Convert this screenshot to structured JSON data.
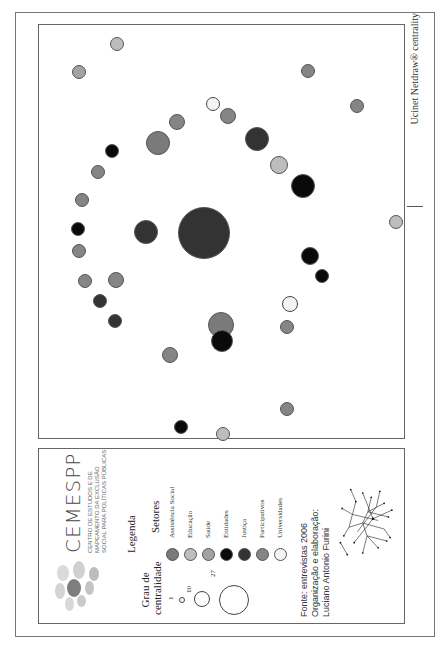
{
  "map": {
    "credit": "Ucinet Netdraw® centrality",
    "nodes": [
      {
        "u": 603,
        "v": 117,
        "r": 7,
        "sector": "Educação"
      },
      {
        "u": 575,
        "v": 79,
        "r": 7,
        "sector": "Saúde"
      },
      {
        "u": 576,
        "v": 308,
        "r": 7,
        "sector": "Participativos"
      },
      {
        "u": 541,
        "v": 357,
        "r": 7,
        "sector": "Participativos"
      },
      {
        "u": 543,
        "v": 213,
        "r": 7,
        "sector": "Universidades"
      },
      {
        "u": 531,
        "v": 228,
        "r": 8,
        "sector": "Participativos"
      },
      {
        "u": 525,
        "v": 177,
        "r": 8,
        "sector": "Participativos"
      },
      {
        "u": 504,
        "v": 158,
        "r": 12,
        "sector": "Assistência Social"
      },
      {
        "u": 508,
        "v": 257,
        "r": 12,
        "sector": "Justiça"
      },
      {
        "u": 496,
        "v": 112,
        "r": 7,
        "sector": "Entidades"
      },
      {
        "u": 482,
        "v": 279,
        "r": 9,
        "sector": "Educação"
      },
      {
        "u": 475,
        "v": 98,
        "r": 7,
        "sector": "Participativos"
      },
      {
        "u": 461,
        "v": 303,
        "r": 12,
        "sector": "Entidades"
      },
      {
        "u": 447,
        "v": 82,
        "r": 7,
        "sector": "Participativos"
      },
      {
        "u": 425,
        "v": 396,
        "r": 7,
        "sector": "Educação"
      },
      {
        "u": 418,
        "v": 78,
        "r": 7,
        "sector": "Entidades"
      },
      {
        "u": 415,
        "v": 146,
        "r": 12,
        "sector": "Justiça"
      },
      {
        "u": 414,
        "v": 204,
        "r": 26,
        "sector": "Justiça"
      },
      {
        "u": 396,
        "v": 79,
        "r": 7,
        "sector": "Participativos"
      },
      {
        "u": 391,
        "v": 310,
        "r": 9,
        "sector": "Entidades"
      },
      {
        "u": 371,
        "v": 322,
        "r": 7,
        "sector": "Entidades"
      },
      {
        "u": 366,
        "v": 85,
        "r": 7,
        "sector": "Participativos"
      },
      {
        "u": 367,
        "v": 116,
        "r": 8,
        "sector": "Participativos"
      },
      {
        "u": 346,
        "v": 100,
        "r": 7,
        "sector": "Justiça"
      },
      {
        "u": 343,
        "v": 290,
        "r": 8,
        "sector": "Universidades"
      },
      {
        "u": 326,
        "v": 115,
        "r": 7,
        "sector": "Justiça"
      },
      {
        "u": 322,
        "v": 221,
        "r": 13,
        "sector": "Assistência Social"
      },
      {
        "u": 320,
        "v": 287,
        "r": 7,
        "sector": "Participativos"
      },
      {
        "u": 306,
        "v": 222,
        "r": 11,
        "sector": "Entidades"
      },
      {
        "u": 292,
        "v": 170,
        "r": 8,
        "sector": "Participativos"
      },
      {
        "u": 238,
        "v": 287,
        "r": 7,
        "sector": "Participativos"
      },
      {
        "u": 220,
        "v": 181,
        "r": 7,
        "sector": "Entidades"
      },
      {
        "u": 213,
        "v": 223,
        "r": 7,
        "sector": "Educação"
      }
    ]
  },
  "legend": {
    "logo": {
      "title": "CEMESPP",
      "subtitle": "Centro de Estudos e de Mapeamento da Exclusão Social para Políticas Públicas"
    },
    "heading": "Legenda",
    "centrality_heading_line1": "Grau de",
    "centrality_heading_line2": "centralidade",
    "sizes": [
      {
        "label": "1",
        "diameter": 6
      },
      {
        "label": "10",
        "diameter": 16
      },
      {
        "label": "27",
        "diameter": 30
      }
    ],
    "sectors_heading": "Setores",
    "sectors": [
      {
        "label": "Assistência Social",
        "color": "#7a7a7a"
      },
      {
        "label": "Educação",
        "color": "#bdbdbd"
      },
      {
        "label": "Saúde",
        "color": "#a3a3a3"
      },
      {
        "label": "Entidades",
        "color": "#0a0a0a"
      },
      {
        "label": "Justiça",
        "color": "#333333"
      },
      {
        "label": "Participativos",
        "color": "#858585"
      },
      {
        "label": "Universidades",
        "color": "#f4f4f4"
      }
    ],
    "source_line1": "Fonte: entrevistas 2006",
    "source_line2": "Organização e elaboração:",
    "source_line3": "Luciano Antonio Furini"
  }
}
